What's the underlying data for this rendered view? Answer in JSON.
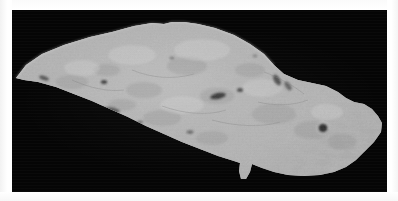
{
  "figure": {
    "kind": "photograph",
    "background_color": "#050505",
    "page_color": "#ffffff",
    "specimen_color_light": "#dcdcdc",
    "specimen_color_mid": "#c4c4c4",
    "specimen_color_dark": "#9a9a9a",
    "caption": ""
  },
  "plate": {
    "left": 12,
    "top": 10,
    "width": 375,
    "height": 182
  },
  "specimen": {
    "outline_note": "Leaf shaped blade: sharp point at left, broad convex upper edge, long straight lower edge sloping down to the right, blunt rounded right end with small notch, and a small tang protruding from the lower edge near centre-right",
    "left_tip_x": 16,
    "right_edge_x": 372,
    "top_edge_y": 22,
    "bottom_edge_y": 178,
    "inclusions": [
      {
        "name": "dark-inclusion-upper-left",
        "cx": 44,
        "cy": 78,
        "rx": 5,
        "ry": 2
      },
      {
        "name": "dark-pit-mid-left",
        "cx": 104,
        "cy": 82,
        "rx": 3,
        "ry": 2
      },
      {
        "name": "dark-streak-left-lower",
        "cx": 112,
        "cy": 110,
        "rx": 7,
        "ry": 3
      },
      {
        "name": "dark-streak-centre",
        "cx": 218,
        "cy": 96,
        "rx": 7,
        "ry": 3
      },
      {
        "name": "dark-pit-centre-right",
        "cx": 240,
        "cy": 90,
        "rx": 3,
        "ry": 2
      },
      {
        "name": "dark-hole-right",
        "cx": 323,
        "cy": 128,
        "rx": 4,
        "ry": 4
      },
      {
        "name": "dark-notch-upper-right",
        "cx": 277,
        "cy": 80,
        "rx": 4,
        "ry": 6
      }
    ]
  }
}
